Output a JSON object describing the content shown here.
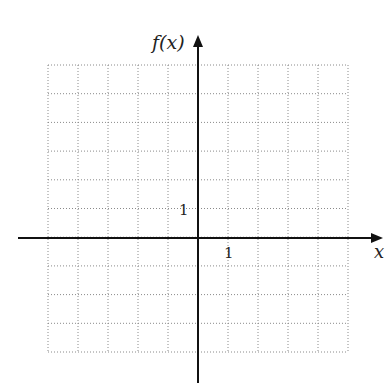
{
  "diagram": {
    "type": "coordinate-grid",
    "y_axis_label": "f(x)",
    "x_axis_label": "x",
    "y_unit_label": "1",
    "x_unit_label": "1",
    "grid": {
      "columns": 10,
      "rows": 10,
      "left": 48,
      "top": 65,
      "right": 348,
      "bottom": 352,
      "line_style": "dotted",
      "line_color": "#8a8a8a"
    },
    "origin": {
      "x": 198,
      "y": 238
    },
    "axis_color": "#111111",
    "x_axis_extent": [
      18,
      383
    ],
    "y_axis_extent": [
      35,
      383
    ]
  }
}
